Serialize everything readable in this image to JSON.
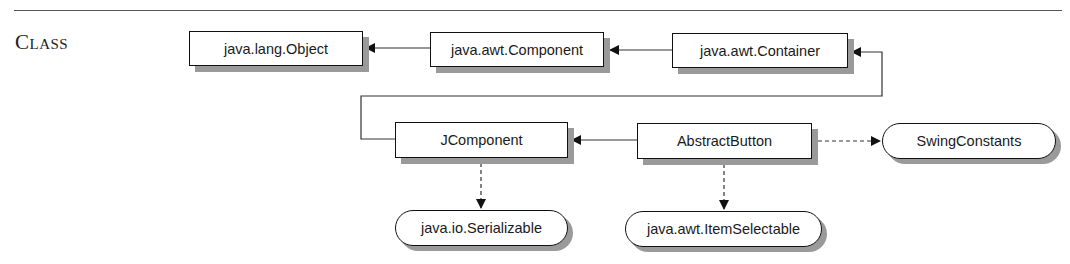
{
  "section": {
    "label": "Class"
  },
  "diagram": {
    "classes": [
      {
        "id": "object",
        "label": "java.lang.Object"
      },
      {
        "id": "component",
        "label": "java.awt.Component"
      },
      {
        "id": "container",
        "label": "java.awt.Container"
      },
      {
        "id": "jcomponent",
        "label": "JComponent"
      },
      {
        "id": "abstractbutton",
        "label": "AbstractButton"
      }
    ],
    "interfaces": [
      {
        "id": "swingconstants",
        "label": "SwingConstants"
      },
      {
        "id": "serializable",
        "label": "java.io.Serializable"
      },
      {
        "id": "itemselectable",
        "label": "java.awt.ItemSelectable"
      }
    ],
    "edges": [
      {
        "from": "component",
        "to": "object",
        "type": "extends"
      },
      {
        "from": "container",
        "to": "component",
        "type": "extends"
      },
      {
        "from": "jcomponent",
        "to": "container",
        "type": "extends"
      },
      {
        "from": "abstractbutton",
        "to": "jcomponent",
        "type": "extends"
      },
      {
        "from": "abstractbutton",
        "to": "swingconstants",
        "type": "implements"
      },
      {
        "from": "jcomponent",
        "to": "serializable",
        "type": "implements"
      },
      {
        "from": "abstractbutton",
        "to": "itemselectable",
        "type": "implements"
      }
    ]
  }
}
